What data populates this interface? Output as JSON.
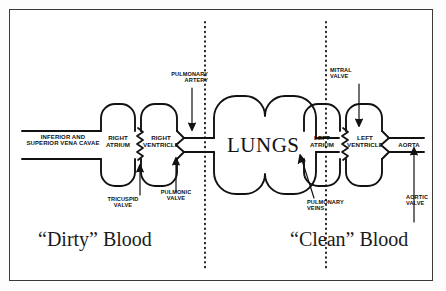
{
  "diagram": {
    "title_center": "LUNGS",
    "left_section_label": "“Dirty” Blood",
    "right_section_label": "“Clean” Blood",
    "vessels": {
      "vena_cavae_line1": "INFERIOR AND",
      "vena_cavae_line2": "SUPERIOR VENA CAVAE",
      "aorta": "AORTA",
      "pulmonary_artery_line1": "PULMONARY",
      "pulmonary_artery_line2": "ARTERY",
      "pulmonary_veins_line1": "PULMONARY",
      "pulmonary_veins_line2": "VEINS"
    },
    "chambers": {
      "right_atrium_line1": "RIGHT",
      "right_atrium_line2": "ATRIUM",
      "right_ventricle_line1": "RIGHT",
      "right_ventricle_line2": "VENTRICLE",
      "left_atrium_line1": "LEFT",
      "left_atrium_line2": "ATRIUM",
      "left_ventricle_line1": "LEFT",
      "left_ventricle_line2": "VENTRICLE"
    },
    "valves": {
      "tricuspid_line1": "TRICUSPID",
      "tricuspid_line2": "VALVE",
      "pulmonic_line1": "PULMONIC",
      "pulmonic_line2": "VALVE",
      "mitral_line1": "MITRAL",
      "mitral_line2": "VALVE",
      "aortic_line1": "AORTIC",
      "aortic_line2": "VALVE"
    },
    "colors": {
      "ink": "#101010",
      "frame": "#3a3a3a",
      "paper": "#ffffff"
    }
  }
}
